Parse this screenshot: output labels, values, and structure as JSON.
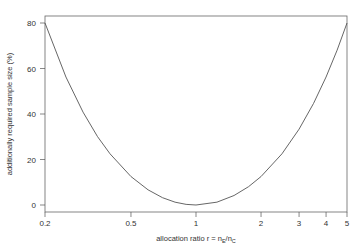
{
  "chart_data": {
    "type": "line",
    "title": "",
    "xlabel": "allocation ratio r = n_E/n_C",
    "xlabel_parts": {
      "main": "allocation ratio r = n",
      "sub1": "E",
      "mid": "/n",
      "sub2": "C"
    },
    "ylabel": "additionally required sample size (%)",
    "xscale": "log",
    "xlim": [
      0.2,
      5
    ],
    "ylim": [
      0,
      80
    ],
    "x_ticks": [
      0.2,
      0.5,
      1,
      2,
      3,
      4,
      5
    ],
    "x_tick_labels": [
      "0.2",
      "0.5",
      "1",
      "2",
      "3",
      "4",
      "5"
    ],
    "y_ticks": [
      0,
      20,
      40,
      60,
      80
    ],
    "y_tick_labels": [
      "0",
      "20",
      "40",
      "60",
      "80"
    ],
    "grid": false,
    "legend": null,
    "series": [
      {
        "name": "additional sample size",
        "x": [
          0.2,
          0.25,
          0.3,
          0.35,
          0.4,
          0.5,
          0.6,
          0.7,
          0.8,
          0.9,
          1,
          1.25,
          1.5,
          1.75,
          2,
          2.5,
          3,
          3.5,
          4,
          4.5,
          5
        ],
        "y": [
          80,
          56.25,
          40.83,
          30.07,
          22.5,
          12.5,
          6.67,
          3.21,
          1.25,
          0.28,
          0,
          1.25,
          4.17,
          8.04,
          12.5,
          22.5,
          33.33,
          44.64,
          56.25,
          68.06,
          80
        ],
        "color": "#555555"
      }
    ]
  },
  "colors": {
    "axis": "#555555",
    "curve": "#555555",
    "text": "#333333"
  }
}
